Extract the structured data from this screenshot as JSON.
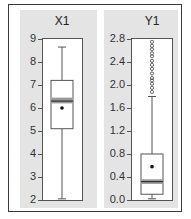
{
  "chart_data": [
    {
      "type": "boxplot",
      "title": "X1",
      "ylim": [
        2,
        9
      ],
      "yticks": [
        "9",
        "8",
        "7",
        "6",
        "5",
        "4",
        "3",
        "2"
      ],
      "grid": false,
      "stats": {
        "whisker_high": 8.65,
        "q3": 7.2,
        "median_band": [
          6.2,
          6.45
        ],
        "median": 6.3,
        "mean": 6.0,
        "q1": 5.1,
        "whisker_low": 2.05,
        "outliers": []
      }
    },
    {
      "type": "boxplot",
      "title": "Y1",
      "ylim": [
        0.0,
        2.8
      ],
      "yticks": [
        "2.8",
        "2.4",
        "2.0",
        "1.6",
        "1.2",
        "0.8",
        "0.4",
        "0.0"
      ],
      "grid": false,
      "stats": {
        "whisker_high": 1.8,
        "q3": 0.8,
        "median_band": [
          0.28,
          0.36
        ],
        "median": 0.32,
        "mean": 0.58,
        "q1": 0.1,
        "whisker_low": 0.02,
        "outliers": [
          1.88,
          1.95,
          2.02,
          2.08,
          2.12,
          2.2,
          2.28,
          2.35,
          2.42,
          2.5,
          2.55,
          2.62,
          2.68,
          2.75
        ]
      }
    }
  ],
  "panels": {
    "left": {
      "title": "X1",
      "ticks": [
        "9",
        "8",
        "7",
        "6",
        "5",
        "4",
        "3",
        "2"
      ]
    },
    "right": {
      "title": "Y1",
      "ticks": [
        "2.8",
        "2.4",
        "2.0",
        "1.6",
        "1.2",
        "0.8",
        "0.4",
        "0.0"
      ]
    }
  },
  "colors": {
    "panel_bg": "#e4e4e4",
    "plot_bg": "#ffffff",
    "median_band": "#9a9a9a",
    "line": "#555555"
  }
}
